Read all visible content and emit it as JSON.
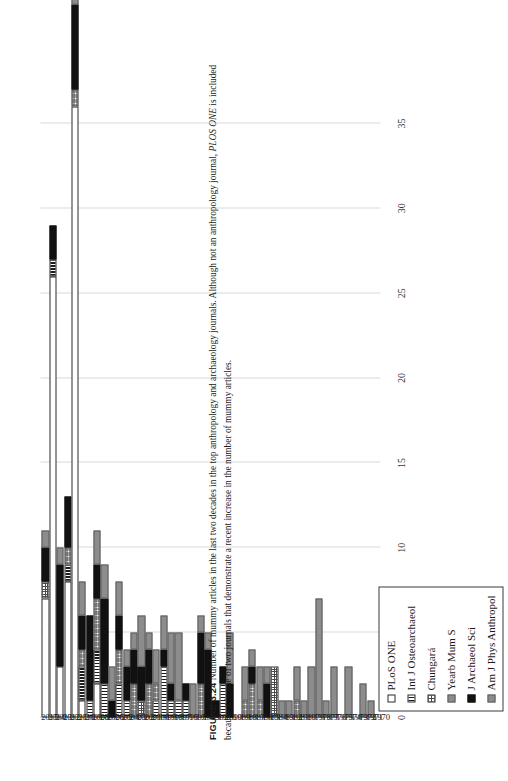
{
  "figure": {
    "number_label": "FIGURE 3.24",
    "caption_part1": "Number of mummy articles in the last two decades in the top anthropology and archaeology journals. Although not an anthropology journal, ",
    "caption_italic": "PLOS ONE",
    "caption_part2": " is included because it is one of two journals that demonstrate a recent increase in the number of mummy articles."
  },
  "legend": {
    "items": [
      {
        "label": "PLoS ONE",
        "swatch": "white-open",
        "color": "#ffffff"
      },
      {
        "label": "Int J Osteoarchaeol",
        "swatch": "vertical-stripe",
        "color": "#1c1c1c"
      },
      {
        "label": "Chungará",
        "swatch": "dotted-grid",
        "color": "#4a4a4a"
      },
      {
        "label": "Yearb Mum S",
        "swatch": "gray-solid",
        "color": "#8c8c8c"
      },
      {
        "label": "J Archaeol Sci",
        "swatch": "black-solid",
        "color": "#111111"
      },
      {
        "label": "Am J Phys Anthropol",
        "swatch": "gray-solid",
        "color": "#8c8c8c"
      }
    ]
  },
  "chart_data": {
    "type": "bar",
    "orientation": "horizontal-stacked",
    "title": "",
    "xlabel": "",
    "ylabel": "",
    "xlim": [
      0,
      37
    ],
    "xticks": [
      0,
      5,
      10,
      15,
      20,
      25,
      30,
      35
    ],
    "grid": true,
    "legend_position": "bottom-left",
    "categories": [
      "2015",
      "2014",
      "2013",
      "2012",
      "2011",
      "2010",
      "2009",
      "2008",
      "2007",
      "2006",
      "2005",
      "2004",
      "2003",
      "2002",
      "2001",
      "2000",
      "1999",
      "1998",
      "1997",
      "1996",
      "1995",
      "1994",
      "1993",
      "1992",
      "1991",
      "1990",
      "1989",
      "1988",
      "1987",
      "1986",
      "1985",
      "1984",
      "1983",
      "1982",
      "1981",
      "1980",
      "1979",
      "1978",
      "1977",
      "1976",
      "1975",
      "1974",
      "1973",
      "1972",
      "1971",
      "1970"
    ],
    "series": [
      {
        "name": "PLoS ONE",
        "values": [
          7,
          26,
          3,
          8,
          36,
          1,
          0,
          2,
          0,
          0,
          0,
          0,
          0,
          0,
          0,
          0,
          0,
          0,
          0,
          0,
          0,
          0,
          0,
          0,
          0,
          0,
          0,
          0,
          0,
          0,
          0,
          0,
          0,
          0,
          0,
          0,
          0,
          0,
          0,
          0,
          0,
          0,
          0,
          0,
          0,
          0
        ]
      },
      {
        "name": "Int J Osteoarchaeol",
        "values": [
          0,
          1,
          0,
          1,
          0,
          2,
          1,
          2,
          2,
          0,
          2,
          1,
          0,
          0,
          0,
          1,
          3,
          1,
          1,
          1,
          0,
          0,
          0,
          0,
          2,
          0,
          0,
          0,
          0,
          0,
          0,
          0,
          0,
          0,
          0,
          0,
          0,
          0,
          0,
          0,
          0,
          0,
          0,
          0,
          0,
          0
        ]
      },
      {
        "name": "Chungará",
        "values": [
          1,
          0,
          0,
          1,
          1,
          1,
          0,
          3,
          0,
          0,
          2,
          0,
          2,
          1,
          2,
          1,
          0,
          0,
          0,
          0,
          0,
          2,
          0,
          0,
          0,
          0,
          0,
          1,
          2,
          1,
          0,
          3,
          0,
          0,
          1,
          0,
          0,
          0,
          0,
          0,
          0,
          0,
          0,
          0,
          0,
          0
        ]
      },
      {
        "name": "Yearb Mum S",
        "values": [
          0,
          0,
          0,
          0,
          0,
          0,
          0,
          0,
          0,
          0,
          0,
          0,
          0,
          0,
          0,
          0,
          0,
          0,
          0,
          0,
          0,
          0,
          0,
          0,
          0,
          0,
          0,
          0,
          0,
          0,
          0,
          0,
          0,
          0,
          0,
          0,
          0,
          0,
          0,
          0,
          0,
          0,
          0,
          0,
          0,
          0
        ]
      },
      {
        "name": "J Archaeol Sci",
        "values": [
          2,
          2,
          6,
          3,
          5,
          2,
          5,
          2,
          5,
          1,
          2,
          2,
          2,
          2,
          2,
          0,
          1,
          1,
          0,
          1,
          0,
          3,
          4,
          1,
          1,
          2,
          0,
          0,
          1,
          0,
          2,
          0,
          0,
          0,
          0,
          0,
          0,
          0,
          0,
          0,
          0,
          0,
          0,
          0,
          0,
          0
        ]
      },
      {
        "name": "Am J Phys Anthropol",
        "values": [
          1,
          0,
          1,
          0,
          1,
          2,
          0,
          2,
          2,
          2,
          2,
          1,
          1,
          3,
          1,
          2,
          2,
          3,
          4,
          0,
          2,
          1,
          1,
          0,
          0,
          3,
          0,
          2,
          1,
          2,
          1,
          0,
          1,
          1,
          2,
          1,
          3,
          7,
          1,
          3,
          0,
          3,
          0,
          2,
          1,
          0
        ]
      }
    ]
  }
}
